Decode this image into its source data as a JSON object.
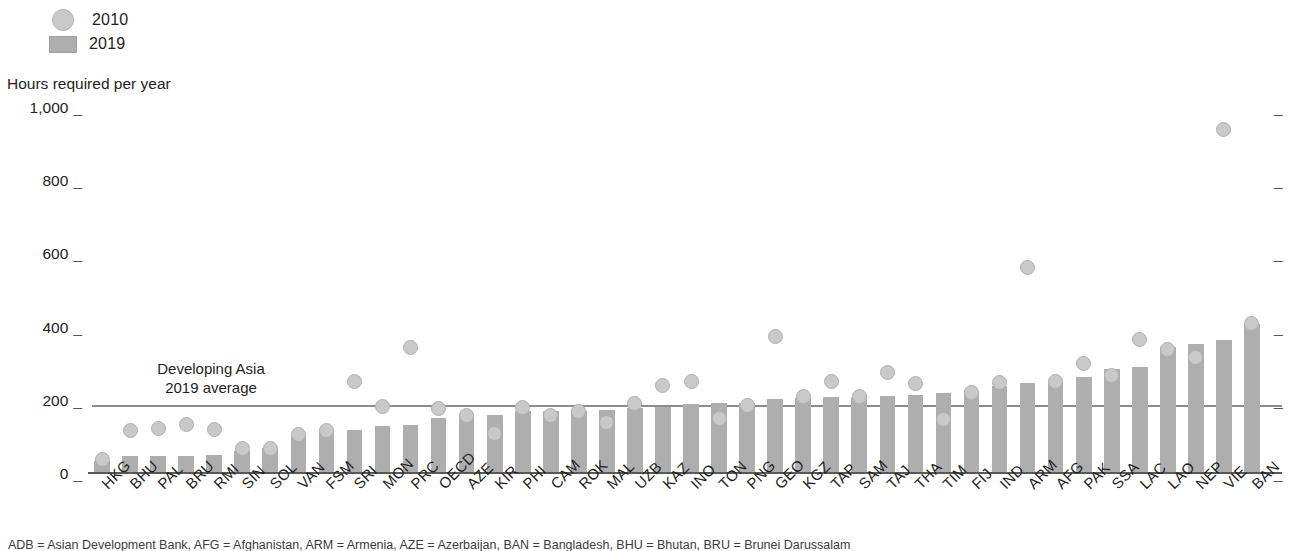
{
  "legend": {
    "items": [
      {
        "label": "2010",
        "marker": "circle-marker",
        "color": "#c9c9c9"
      },
      {
        "label": "2019",
        "marker": "square-marker",
        "color": "#aeaeae"
      }
    ]
  },
  "axis_title": "Hours required per year",
  "annotation": {
    "line1": "Developing Asia",
    "line2": "2019 average",
    "value": 188
  },
  "colors": {
    "bar_2019": "#aeaeae",
    "dot_2010": "#c9c9c9",
    "dot_2010_stroke": "#b0b0b0",
    "axis": "#58595b",
    "average_line": "#8c8c8c",
    "text": "#231f20"
  },
  "chart_data": {
    "type": "bar",
    "title": "",
    "subtitle": "",
    "xlabel": "",
    "ylabel": "Hours required per year",
    "ylim": [
      0,
      1000
    ],
    "yticks": [
      0,
      200,
      400,
      600,
      800,
      1000
    ],
    "ytick_labels": [
      "0",
      "200",
      "400",
      "600",
      "800",
      "1,000"
    ],
    "grid": false,
    "legend_position": "top-left",
    "categories": [
      "HKG",
      "BHU",
      "PAL",
      "BRU",
      "RMI",
      "SIN",
      "SOL",
      "VAN",
      "FSM",
      "SRI",
      "MON",
      "PRC",
      "OECD",
      "AZE",
      "KIR",
      "PHI",
      "CAM",
      "ROK",
      "MAL",
      "UZB",
      "KAZ",
      "INO",
      "TON",
      "PNG",
      "GEO",
      "KGZ",
      "TAP",
      "SAM",
      "TAJ",
      "THA",
      "TIM",
      "FIJ",
      "IND",
      "ARM",
      "AFG",
      "PAK",
      "SSA",
      "LAC",
      "LAO",
      "NEP",
      "VIE",
      "BAN"
    ],
    "series": [
      {
        "name": "2019",
        "type": "bar",
        "color": "#aeaeae",
        "values": [
          35,
          48,
          49,
          49,
          52,
          64,
          71,
          105,
          115,
          121,
          130,
          135,
          152,
          158,
          160,
          172,
          173,
          173,
          175,
          180,
          182,
          190,
          193,
          194,
          206,
          209,
          210,
          210,
          213,
          216,
          222,
          226,
          240,
          250,
          252,
          265,
          288,
          292,
          348,
          356,
          366,
          410
        ]
      },
      {
        "name": "2010",
        "type": "scatter",
        "color": "#c9c9c9",
        "values": [
          40,
          119,
          124,
          136,
          122,
          70,
          71,
          108,
          118,
          252,
          184,
          345,
          180,
          160,
          110,
          182,
          160,
          170,
          140,
          193,
          243,
          253,
          151,
          187,
          375,
          212,
          252,
          212,
          278,
          247,
          148,
          222,
          250,
          565,
          252,
          302,
          268,
          367,
          340,
          318,
          940,
          410
        ]
      }
    ],
    "reference_line": {
      "label": "Developing Asia 2019 average",
      "value": 188
    }
  },
  "footnote": "ADB = Asian Development Bank, AFG = Afghanistan, ARM = Armenia, AZE = Azerbaijan, BAN = Bangladesh, BHU = Bhutan, BRU = Brunei Darussalam"
}
